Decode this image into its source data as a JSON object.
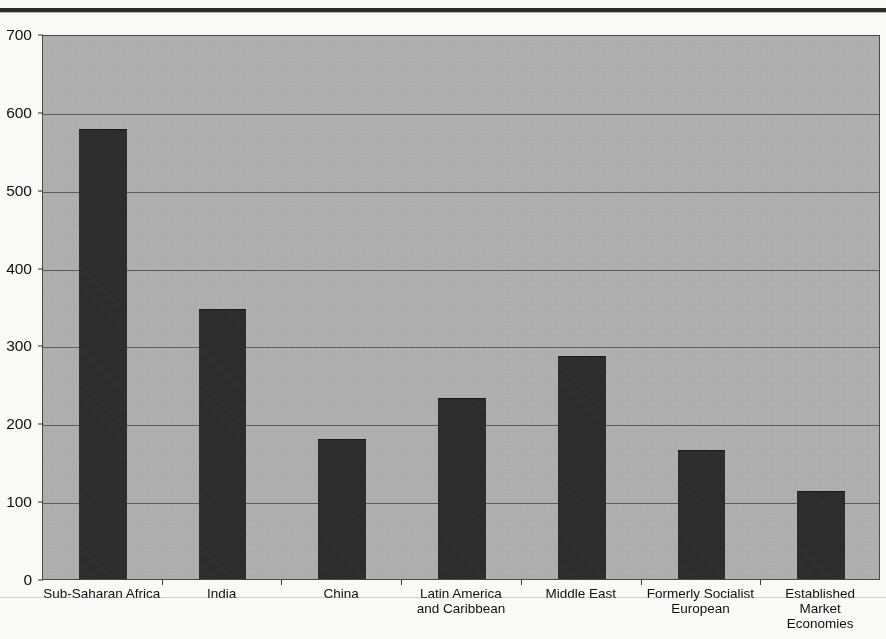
{
  "chart_data": {
    "type": "bar",
    "title": "",
    "subtitle": "",
    "xlabel": "",
    "ylabel": "",
    "categories": [
      "Sub-Saharan Africa",
      "India",
      "China",
      "Latin America\nand Caribbean",
      "Middle East",
      "Formerly Socialist\nEuropean",
      "Established\nMarket\nEconomies"
    ],
    "values": [
      577,
      345,
      178,
      231,
      285,
      165,
      112
    ],
    "ylim": [
      0,
      700
    ],
    "yticks": [
      0,
      100,
      200,
      300,
      400,
      500,
      600,
      700
    ],
    "ytick_labels": [
      "0",
      "100",
      "200",
      "300",
      "400",
      "500",
      "600",
      "700"
    ],
    "grid": true,
    "grid_axis": "y",
    "legend": false,
    "legend_position": "none",
    "series": [
      {
        "name": "",
        "values": [
          577,
          345,
          178,
          231,
          285,
          165,
          112
        ]
      }
    ]
  },
  "style": {
    "plot_background": "#b2b2b2",
    "bar_color": "#2b2b2b",
    "grid_color": "#4f4f4f",
    "axis_color": "#1b1b1b",
    "text_color": "#101010",
    "page_background": "#fdfdfc"
  }
}
